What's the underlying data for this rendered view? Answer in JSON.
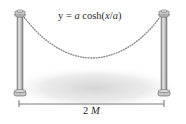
{
  "diagram": {
    "formula": {
      "prefix": "y = ",
      "a1": "a",
      "func": " cosh(",
      "x": "x",
      "slash": "/",
      "a2": "a",
      "close": ")"
    },
    "dimension": {
      "value": "2 ",
      "unit": "M"
    },
    "elements": [
      "left-post",
      "right-post",
      "hanging-rope",
      "ground-shadow",
      "dimension-line"
    ],
    "colors": {
      "post": "#b8b8b8",
      "post_dark": "#6e6e6e",
      "rope": "#8a8a8a",
      "shadow": "#d9d9d9",
      "text": "#2a2a2a"
    }
  }
}
